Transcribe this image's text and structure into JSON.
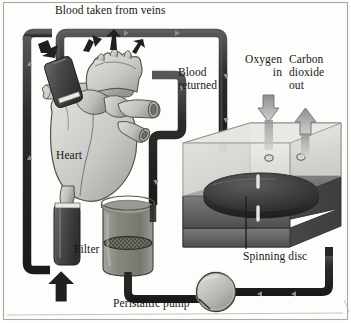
{
  "figure": {
    "kind": "anatomical-schematic",
    "palette": {
      "ink": "#171717",
      "tube_dark": "#2b2b2b",
      "tube_mid": "#4a4a4a",
      "organ_light": "#d8d8d4",
      "organ_mid": "#bdbdb9",
      "organ_shadow": "#8e8e8a",
      "chamber_glass": "#e4e4e2",
      "chamber_base": "#6f6f6f",
      "chamber_base_dark": "#545454",
      "disc_dark": "#3a3a3a",
      "fluid": "#8a8a86",
      "pump_fill": "#b9b9b5",
      "gas_arrow": "#8c8c8c",
      "frame": "#9a9a96",
      "background": "#fdfdfb"
    },
    "labels": {
      "title": "Blood taken from veins",
      "blood_returned": "Blood\nreturned",
      "oxygen_in": "Oxygen\nin",
      "carbon_dioxide_out": "Carbon\ndioxide\nout",
      "heart": "Heart",
      "filter": "Filter",
      "spinning_disc": "Spinning disc",
      "peristaltic_pump": "Peristaltic pump"
    },
    "components": [
      {
        "name": "heart",
        "label": "Heart"
      },
      {
        "name": "filter",
        "label": "Filter"
      },
      {
        "name": "oxygenator-chamber",
        "label": "Spinning disc"
      },
      {
        "name": "peristaltic-pump",
        "label": "Peristaltic pump"
      }
    ],
    "gas_exchange": [
      {
        "name": "oxygen-in",
        "label": "Oxygen\nin",
        "direction": "down"
      },
      {
        "name": "carbon-dioxide-out",
        "label": "Carbon\ndioxide\nout",
        "direction": "up"
      }
    ],
    "flow_arrows": [
      {
        "name": "venous-cannula-arrow",
        "direction": "down"
      },
      {
        "name": "aortic-outflow-arrow-left",
        "direction": "up"
      },
      {
        "name": "aortic-outflow-arrow-center",
        "direction": "up"
      },
      {
        "name": "aortic-outflow-arrow-right",
        "direction": "up"
      },
      {
        "name": "arterial-return-arrow",
        "direction": "up"
      }
    ]
  }
}
